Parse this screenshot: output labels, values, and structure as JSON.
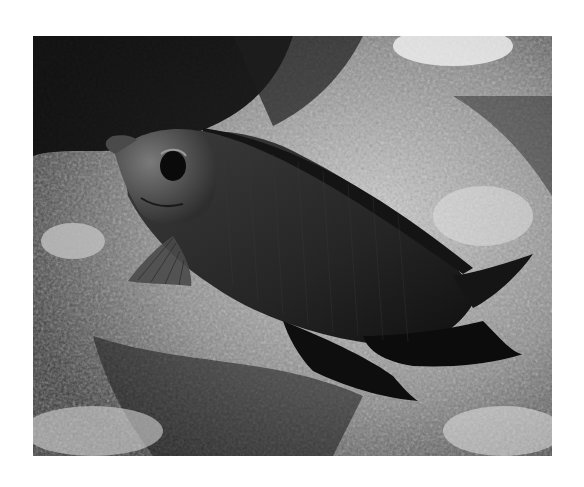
{
  "photo": {
    "subject": "rabbitfish swimming over reef",
    "tone": "grayscale",
    "colors": {
      "background": "#ffffff",
      "fish_body": "#2a2a2a",
      "fish_head": "#5a5a5a",
      "reef_light": "#d8d8d8",
      "reef_dark": "#1a1a1a"
    }
  }
}
